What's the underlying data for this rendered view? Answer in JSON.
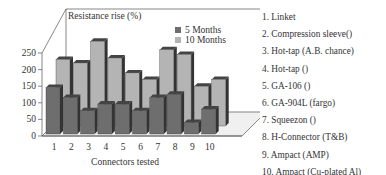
{
  "chart_data": {
    "type": "bar",
    "title": "Resistance rise (%)",
    "xlabel": "Connectors tested",
    "ylabel": "Resistance rise (%)",
    "ylim": [
      0,
      250
    ],
    "yticks": [
      0,
      50,
      100,
      150,
      200,
      250
    ],
    "categories": [
      "1",
      "2",
      "3",
      "4",
      "5",
      "6",
      "7",
      "8",
      "9",
      "10"
    ],
    "series": [
      {
        "name": "5 Months",
        "color": "#6e6e6e",
        "values": [
          140,
          110,
          70,
          90,
          90,
          70,
          110,
          120,
          35,
          75
        ]
      },
      {
        "name": "10 Months",
        "color": "#b4b4b4",
        "values": [
          200,
          190,
          255,
          205,
          160,
          140,
          230,
          215,
          120,
          140
        ]
      }
    ],
    "legend_position": "top-right",
    "grid": false,
    "style": "3d"
  },
  "connector_list": [
    "1. Linket",
    "2. Compression sleeve()",
    "3. Hot-tap (A.B. chance)",
    "4. Hot-tap ()",
    "5. GA-106 ()",
    "6. GA-904L (fargo)",
    "7. Squeezon ()",
    "8. H-Connector (T&B)",
    "9. Ampact (AMP)",
    "10. Ampact (Cu-plated Al)"
  ]
}
